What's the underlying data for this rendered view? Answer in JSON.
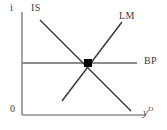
{
  "diagram": {
    "type": "islm-bp-open-economy-equilibrium",
    "axes": {
      "y_axis_label": "i",
      "x_axis_label_base": "y",
      "x_axis_label_superscript": "D",
      "origin_label": "0",
      "axis_color": "#8c8c8c"
    },
    "curves": [
      {
        "name": "IS",
        "label": "IS",
        "slope": "downward",
        "color": "#3a3a3a",
        "x1": 40,
        "y1": 20,
        "x2": 131,
        "y2": 111
      },
      {
        "name": "LM",
        "label": "LM",
        "slope": "upward",
        "color": "#3a3a3a",
        "x1": 62,
        "y1": 101,
        "x2": 122,
        "y2": 22
      },
      {
        "name": "BP",
        "label": "BP",
        "slope": "horizontal",
        "color": "#8c8c8c",
        "x1": 22,
        "y1": 63,
        "x2": 137,
        "y2": 63
      }
    ],
    "equilibrium_point": {
      "label": "",
      "marker": "filled-square",
      "color": "#000000",
      "x": 88,
      "y": 63
    }
  }
}
